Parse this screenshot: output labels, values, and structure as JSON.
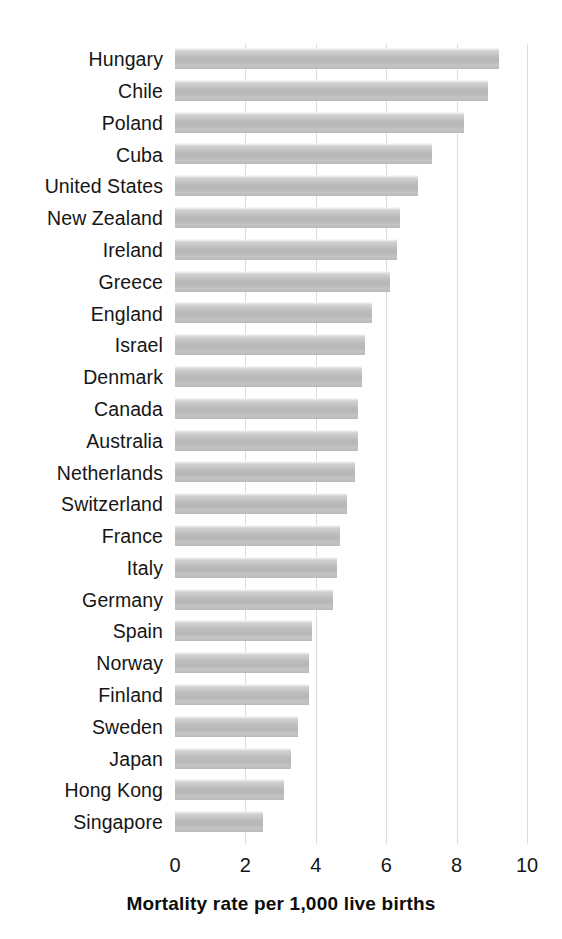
{
  "chart_data": {
    "type": "bar",
    "orientation": "horizontal",
    "title": "",
    "subtitle": "",
    "xlabel": "Mortality rate per 1,000 live births",
    "ylabel": "",
    "xlim": [
      0,
      10
    ],
    "xticks": [
      0,
      2,
      4,
      6,
      8,
      10
    ],
    "xtick_labels": [
      "0",
      "2",
      "4",
      "6",
      "8",
      "10"
    ],
    "grid": true,
    "grid_axis": "x",
    "legend": false,
    "bar_color": "#bdbdbd",
    "categories": [
      "Hungary",
      "Chile",
      "Poland",
      "Cuba",
      "United States",
      "New Zealand",
      "Ireland",
      "Greece",
      "England",
      "Israel",
      "Denmark",
      "Canada",
      "Australia",
      "Netherlands",
      "Switzerland",
      "France",
      "Italy",
      "Germany",
      "Spain",
      "Norway",
      "Finland",
      "Sweden",
      "Japan",
      "Hong Kong",
      "Singapore"
    ],
    "values": [
      9.2,
      8.9,
      8.2,
      7.3,
      6.9,
      6.4,
      6.3,
      6.1,
      5.6,
      5.4,
      5.3,
      5.2,
      5.2,
      5.1,
      4.9,
      4.7,
      4.6,
      4.5,
      3.9,
      3.8,
      3.8,
      3.5,
      3.3,
      3.1,
      2.5
    ],
    "bars": [
      {
        "label": "Hungary",
        "value": 9.2
      },
      {
        "label": "Chile",
        "value": 8.9
      },
      {
        "label": "Poland",
        "value": 8.2
      },
      {
        "label": "Cuba",
        "value": 7.3
      },
      {
        "label": "United States",
        "value": 6.9
      },
      {
        "label": "New Zealand",
        "value": 6.4
      },
      {
        "label": "Ireland",
        "value": 6.3
      },
      {
        "label": "Greece",
        "value": 6.1
      },
      {
        "label": "England",
        "value": 5.6
      },
      {
        "label": "Israel",
        "value": 5.4
      },
      {
        "label": "Denmark",
        "value": 5.3
      },
      {
        "label": "Canada",
        "value": 5.2
      },
      {
        "label": "Australia",
        "value": 5.2
      },
      {
        "label": "Netherlands",
        "value": 5.1
      },
      {
        "label": "Switzerland",
        "value": 4.9
      },
      {
        "label": "France",
        "value": 4.7
      },
      {
        "label": "Italy",
        "value": 4.6
      },
      {
        "label": "Germany",
        "value": 4.5
      },
      {
        "label": "Spain",
        "value": 3.9
      },
      {
        "label": "Norway",
        "value": 3.8
      },
      {
        "label": "Finland",
        "value": 3.8
      },
      {
        "label": "Sweden",
        "value": 3.5
      },
      {
        "label": "Japan",
        "value": 3.3
      },
      {
        "label": "Hong Kong",
        "value": 3.1
      },
      {
        "label": "Singapore",
        "value": 2.5
      }
    ]
  }
}
